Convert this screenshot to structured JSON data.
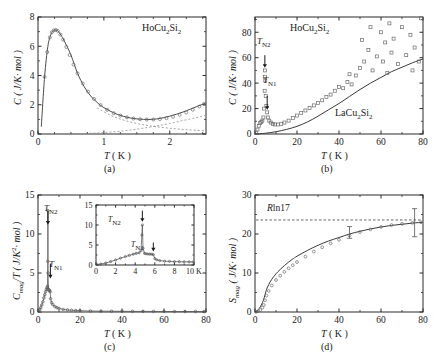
{
  "figure": {
    "panels": [
      {
        "id": "a",
        "letter": "(a)",
        "compound_label": "HoCu2Si2",
        "xlabel": "T ( K )",
        "ylabel": "C ( J/K· mol )",
        "xticks": [
          "0",
          "1",
          "2"
        ],
        "yticks": [
          "0",
          "2",
          "4",
          "6",
          "8"
        ]
      },
      {
        "id": "b",
        "letter": "(b)",
        "compound_label": "HoCu2Si2",
        "reference_label": "LaCu2Si2",
        "xlabel": "T ( K )",
        "ylabel": "C ( J/K· mol )",
        "xticks": [
          "0",
          "20",
          "40",
          "60",
          "80"
        ],
        "yticks": [
          "0",
          "20",
          "40",
          "60",
          "80"
        ],
        "annotations": [
          "TN2",
          "TN1"
        ]
      },
      {
        "id": "c",
        "letter": "(c)",
        "xlabel": "T ( K )",
        "ylabel": "Cmag/T ( J/K2· mol )",
        "xticks": [
          "0",
          "20",
          "40",
          "60",
          "80"
        ],
        "yticks": [
          "0",
          "5",
          "10",
          "15"
        ],
        "annotations": [
          "TN2",
          "TN1"
        ],
        "inset": {
          "xticks": [
            "0",
            "2",
            "4",
            "6",
            "8",
            "10 K"
          ],
          "yticks": [
            "0",
            "5",
            "10",
            "15"
          ],
          "annotations": [
            "TN2",
            "TN1"
          ]
        }
      },
      {
        "id": "d",
        "letter": "(d)",
        "xlabel": "T ( K )",
        "ylabel": "Smag ( J/K· mol )",
        "xticks": [
          "0",
          "20",
          "40",
          "60",
          "80"
        ],
        "yticks": [
          "0",
          "10",
          "20",
          "30"
        ],
        "entropy_limit_label": "Rln17"
      }
    ]
  },
  "chart_data": [
    {
      "type": "line",
      "panel": "a",
      "title": "HoCu2Si2 low-temperature heat capacity",
      "xlabel": "T ( K )",
      "ylabel": "C ( J/K· mol )",
      "xlim": [
        0,
        2.55
      ],
      "ylim": [
        0,
        8
      ],
      "xticks": [
        0,
        1,
        2
      ],
      "yticks": [
        0,
        2,
        4,
        6,
        8
      ],
      "grid": false,
      "legend": false,
      "series": [
        {
          "name": "HoCu2Si2 measured (open circles)",
          "style": "open-circles",
          "x": [
            0.1,
            0.14,
            0.18,
            0.21,
            0.24,
            0.27,
            0.3,
            0.34,
            0.38,
            0.43,
            0.48,
            0.54,
            0.6,
            0.68,
            0.76,
            0.85,
            0.95,
            1.05,
            1.15,
            1.25,
            1.35,
            1.45,
            1.55,
            1.65,
            1.75,
            1.85,
            1.95,
            2.05,
            2.15,
            2.25,
            2.35,
            2.45,
            2.52
          ],
          "y": [
            3.9,
            5.6,
            6.6,
            6.95,
            7.08,
            7.12,
            7.05,
            6.8,
            6.45,
            5.95,
            5.4,
            4.75,
            4.15,
            3.45,
            2.9,
            2.4,
            1.98,
            1.65,
            1.42,
            1.26,
            1.14,
            1.06,
            1.01,
            0.99,
            0.99,
            1.02,
            1.08,
            1.18,
            1.31,
            1.47,
            1.66,
            1.88,
            2.05
          ]
        },
        {
          "name": "total fit (solid line)",
          "style": "solid",
          "x": [
            0.05,
            0.1,
            0.15,
            0.2,
            0.25,
            0.3,
            0.35,
            0.4,
            0.5,
            0.6,
            0.7,
            0.8,
            0.9,
            1.0,
            1.2,
            1.4,
            1.6,
            1.8,
            2.0,
            2.2,
            2.4,
            2.55
          ],
          "y": [
            0.5,
            3.9,
            6.0,
            6.85,
            7.1,
            7.05,
            6.75,
            6.35,
            5.4,
            4.15,
            3.25,
            2.6,
            2.15,
            1.8,
            1.35,
            1.1,
            1.0,
            1.03,
            1.22,
            1.5,
            1.86,
            2.12
          ]
        },
        {
          "name": "nuclear/Schottky component (dashed)",
          "style": "dashed",
          "x": [
            0.6,
            0.8,
            1.0,
            1.2,
            1.4,
            1.6,
            1.8,
            2.0,
            2.2,
            2.4,
            2.55
          ],
          "y": [
            0.02,
            0.05,
            0.1,
            0.17,
            0.27,
            0.4,
            0.55,
            0.72,
            0.92,
            1.12,
            1.28
          ]
        },
        {
          "name": "lattice/tail component (dashed)",
          "style": "dashed",
          "x": [
            0.9,
            1.1,
            1.3,
            1.5,
            1.7,
            1.9,
            2.1,
            2.3,
            2.55
          ],
          "y": [
            1.78,
            1.28,
            0.95,
            0.72,
            0.56,
            0.44,
            0.35,
            0.28,
            0.22
          ]
        }
      ]
    },
    {
      "type": "scatter",
      "panel": "b",
      "title": "HoCu2Si2 heat capacity 0-80 K with LaCu2Si2 reference",
      "xlabel": "T ( K )",
      "ylabel": "C ( J/K· mol )",
      "xlim": [
        0,
        80
      ],
      "ylim": [
        0,
        92
      ],
      "xticks": [
        0,
        20,
        40,
        60,
        80
      ],
      "yticks": [
        0,
        20,
        40,
        60,
        80
      ],
      "grid": false,
      "annotations": [
        {
          "label": "TN2",
          "x": 4.7,
          "y": 50
        },
        {
          "label": "TN1",
          "x": 5.8,
          "y": 20
        }
      ],
      "series": [
        {
          "name": "HoCu2Si2 (open squares)",
          "style": "open-squares",
          "x": [
            0.5,
            1.2,
            1.8,
            2.4,
            3.0,
            3.5,
            4.0,
            4.3,
            4.6,
            4.7,
            4.75,
            4.9,
            5.1,
            5.4,
            5.8,
            6.2,
            6.8,
            7.5,
            8.5,
            9.5,
            11,
            12.5,
            14,
            16,
            18,
            20,
            22,
            24,
            26,
            28,
            30,
            32,
            34,
            36,
            38,
            40,
            42,
            44,
            45,
            46,
            48,
            50,
            51,
            52,
            54,
            55,
            56,
            58,
            60,
            61,
            62,
            63,
            64,
            65,
            66,
            68,
            70,
            72,
            74,
            75,
            76,
            78,
            79
          ],
          "y": [
            1.0,
            3.5,
            6.5,
            8.5,
            9.5,
            10.5,
            13,
            20,
            34,
            45,
            50,
            42,
            30,
            22,
            17,
            13,
            10.5,
            9.0,
            8.0,
            7.5,
            7.5,
            8.0,
            9.0,
            10.5,
            12.5,
            14.5,
            16.5,
            18.5,
            20.5,
            22.5,
            24.5,
            26.5,
            29,
            31,
            34,
            37,
            36,
            41,
            47,
            39,
            46,
            52,
            74,
            57,
            66,
            84,
            50,
            61,
            80,
            57,
            72,
            48,
            87,
            64,
            75,
            55,
            84,
            62,
            78,
            50,
            68,
            57,
            91
          ]
        },
        {
          "name": "LaCu2Si2 (solid line)",
          "style": "solid",
          "x": [
            0,
            5,
            10,
            15,
            20,
            25,
            30,
            35,
            40,
            45,
            50,
            55,
            60,
            65,
            70,
            75,
            80
          ],
          "y": [
            0,
            0.6,
            1.8,
            3.6,
            6.0,
            9.5,
            14,
            19,
            24,
            29.5,
            35,
            40,
            44.5,
            49,
            52.5,
            56,
            59
          ]
        }
      ]
    },
    {
      "type": "line",
      "panel": "c",
      "title": "Magnetic heat capacity divided by temperature",
      "xlabel": "T ( K )",
      "ylabel": "Cmag/T ( J/K2· mol )",
      "xlim": [
        0,
        80
      ],
      "ylim": [
        0,
        15
      ],
      "xticks": [
        0,
        20,
        40,
        60,
        80
      ],
      "yticks": [
        0,
        5,
        10,
        15
      ],
      "grid": false,
      "annotations": [
        {
          "label": "TN2",
          "x": 4.7,
          "y": 11
        },
        {
          "label": "TN1",
          "x": 5.8,
          "y": 4.5
        }
      ],
      "series": [
        {
          "name": "Cmag/T (open circles)",
          "style": "open-circles",
          "x": [
            0.3,
            0.8,
            1.3,
            1.8,
            2.3,
            2.8,
            3.2,
            3.6,
            4.0,
            4.3,
            4.5,
            4.65,
            4.72,
            4.8,
            5.0,
            5.2,
            5.5,
            5.8,
            6.0,
            6.5,
            7.0,
            8.0,
            9.0,
            10,
            12,
            14,
            16,
            18,
            20,
            25,
            30,
            35,
            40,
            45,
            50,
            55,
            60,
            65,
            70,
            75,
            79
          ],
          "y": [
            0.15,
            0.3,
            0.55,
            0.9,
            1.3,
            1.8,
            2.2,
            2.6,
            2.9,
            3.1,
            3.3,
            6.5,
            13.0,
            5.0,
            2.9,
            2.8,
            2.75,
            2.6,
            1.7,
            1.2,
            0.95,
            0.7,
            0.55,
            0.45,
            0.33,
            0.26,
            0.22,
            0.19,
            0.17,
            0.13,
            0.11,
            0.1,
            0.09,
            0.08,
            0.08,
            0.07,
            0.07,
            0.06,
            0.06,
            0.06,
            0.05
          ]
        }
      ],
      "inset": {
        "type": "line",
        "xlabel": "",
        "ylabel": "",
        "xlim": [
          0,
          10
        ],
        "ylim": [
          0,
          15
        ],
        "xticks": [
          0,
          2,
          4,
          6,
          8,
          10
        ],
        "yticks": [
          0,
          5,
          10,
          15
        ],
        "annotations": [
          {
            "label": "TN2",
            "x": 4.7,
            "y": 12
          },
          {
            "label": "TN1",
            "x": 5.8,
            "y": 6
          }
        ],
        "series": [
          {
            "name": "Cmag/T (open circles)",
            "style": "open-circles",
            "x": [
              0.1,
              0.5,
              1.0,
              1.5,
              2.0,
              2.5,
              3.0,
              3.4,
              3.8,
              4.1,
              4.4,
              4.6,
              4.68,
              4.73,
              4.8,
              4.95,
              5.1,
              5.3,
              5.5,
              5.7,
              5.85,
              6.0,
              6.2,
              6.5,
              7.0,
              7.5,
              8.0,
              8.5,
              9.0,
              9.5,
              9.9
            ],
            "y": [
              0.1,
              0.25,
              0.5,
              0.85,
              1.25,
              1.7,
              2.1,
              2.4,
              2.7,
              2.9,
              3.05,
              3.6,
              7.5,
              10.0,
              4.2,
              2.9,
              2.8,
              2.75,
              2.7,
              2.7,
              2.6,
              1.6,
              1.3,
              1.1,
              0.95,
              0.9,
              0.85,
              0.82,
              0.8,
              0.78,
              0.75
            ]
          }
        ]
      }
    },
    {
      "type": "line",
      "panel": "d",
      "title": "Magnetic entropy versus temperature",
      "xlabel": "T ( K )",
      "ylabel": "Smag ( J/K· mol )",
      "xlim": [
        0,
        80
      ],
      "ylim": [
        0,
        30
      ],
      "xticks": [
        0,
        20,
        40,
        60,
        80
      ],
      "yticks": [
        0,
        10,
        20,
        30
      ],
      "grid": false,
      "reference_line": {
        "label": "Rln17",
        "value": 23.6,
        "style": "dashed"
      },
      "series": [
        {
          "name": "Smag (open circles)",
          "style": "open-circles",
          "x": [
            0.5,
            1.5,
            2.5,
            3.5,
            4.2,
            4.8,
            5.5,
            6.5,
            8,
            10,
            12,
            14,
            16,
            18,
            20,
            24,
            28,
            32,
            36,
            40,
            45,
            50,
            55,
            60,
            65,
            70,
            75,
            79
          ],
          "y": [
            0.05,
            0.2,
            0.5,
            1.1,
            1.8,
            3.0,
            4.2,
            5.4,
            6.8,
            8.2,
            9.3,
            10.3,
            11.2,
            12.0,
            12.8,
            14.2,
            15.5,
            16.6,
            17.6,
            18.5,
            19.6,
            20.5,
            21.2,
            21.8,
            22.3,
            22.6,
            22.85,
            23.0
          ]
        },
        {
          "name": "Smag (solid line)",
          "style": "solid",
          "x": [
            0.3,
            1.0,
            2.0,
            3.0,
            4.0,
            4.8,
            5.5,
            6.5,
            8,
            10,
            12,
            14,
            16,
            18,
            20,
            25,
            30,
            35,
            40,
            45,
            50,
            55,
            60,
            65,
            70,
            75,
            80
          ],
          "y": [
            0.05,
            0.3,
            0.9,
            1.8,
            3.0,
            4.5,
            5.8,
            7.0,
            8.4,
            9.8,
            10.9,
            11.9,
            12.8,
            13.6,
            14.3,
            15.8,
            17.1,
            18.2,
            19.1,
            20.0,
            20.7,
            21.3,
            21.8,
            22.2,
            22.5,
            22.8,
            23.0
          ]
        }
      ],
      "error_bars": [
        {
          "x": 45,
          "y": 20.4,
          "err": 1.5
        },
        {
          "x": 76,
          "y": 22.9,
          "err": 3.6
        }
      ]
    }
  ]
}
